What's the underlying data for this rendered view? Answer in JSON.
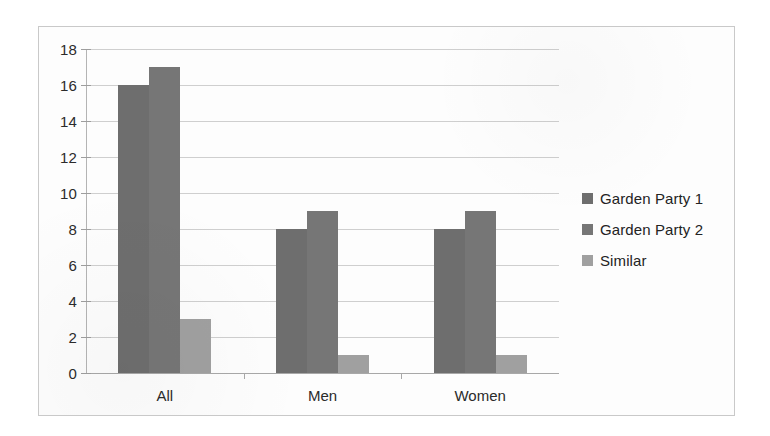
{
  "chart_data": {
    "type": "bar",
    "title": "",
    "subtitle": "",
    "xlabel": "",
    "ylabel": "",
    "categories": [
      "All",
      "Men",
      "Women"
    ],
    "series": [
      {
        "name": "Garden Party 1",
        "values": [
          16,
          8,
          8
        ],
        "color": "#6e6e6e"
      },
      {
        "name": "Garden Party 2",
        "values": [
          17,
          9,
          9
        ],
        "color": "#767676"
      },
      {
        "name": "Similar",
        "values": [
          3,
          1,
          1
        ],
        "color": "#a0a0a0"
      }
    ],
    "ylim": [
      0,
      18
    ],
    "ytick_step": 2,
    "yticks": [
      18,
      16,
      14,
      12,
      10,
      8,
      6,
      4,
      2,
      0
    ],
    "ytick_labels": [
      "18",
      "16",
      "14",
      "12",
      "10",
      "8",
      "6",
      "4",
      "2",
      "0"
    ],
    "grid": true,
    "grid_axis": "y",
    "legend_position": "right",
    "bar_gap_within_group": 0,
    "annotations": []
  },
  "legend": {
    "entries": [
      {
        "label": "Garden Party 1"
      },
      {
        "label": "Garden Party 2"
      },
      {
        "label": "Similar"
      }
    ]
  },
  "colors": {
    "series_1": "#6e6e6e",
    "series_2": "#767676",
    "series_3": "#a0a0a0",
    "gridline": "#cfcfcf",
    "axis": "#a8a8a8",
    "border": "#c9c9c9",
    "background": "#fdfdfd",
    "text": "#2b2b2b"
  }
}
